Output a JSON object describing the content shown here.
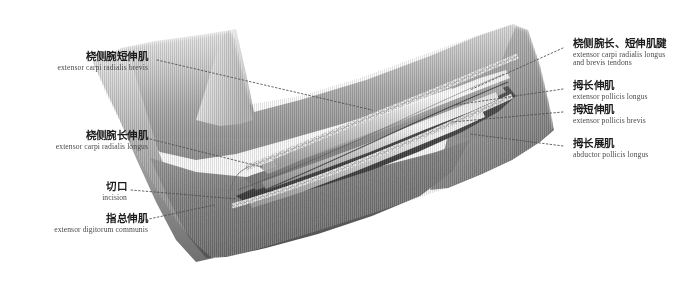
{
  "figure": {
    "style": "grayscale medical illustration",
    "background_color": "#ffffff",
    "ink_color": "#1c1c1c",
    "leader_color": "#4d4d4d"
  },
  "labels_left": [
    {
      "cn": "桡侧腕短伸肌",
      "la": "extensor carpi radialis brevis",
      "anchor": "skin-flap-upper-left"
    },
    {
      "cn": "桡侧腕长伸肌",
      "la": "extensor carpi radialis longus",
      "anchor": "muscle-belly-mid-left"
    },
    {
      "cn": "切口",
      "la": "incision",
      "anchor": "incision-edge-lower"
    },
    {
      "cn": "指总伸肌",
      "la": "extensor digitorum communis",
      "anchor": "muscle-flap-lower-left"
    }
  ],
  "labels_right": [
    {
      "cn": "桡侧腕长、短伸肌腱",
      "la": "extensor carpi radialis longus\nand brevis tendons",
      "anchor": "tendon-group-upper-right"
    },
    {
      "cn": "拇长伸肌",
      "la": "extensor pollicis longus",
      "anchor": "tendon-epl"
    },
    {
      "cn": "拇短伸肌",
      "la": "extensor pollicis brevis",
      "anchor": "tendon-epb"
    },
    {
      "cn": "拇长展肌",
      "la": "abductor pollicis longus",
      "anchor": "muscle-apl"
    }
  ]
}
